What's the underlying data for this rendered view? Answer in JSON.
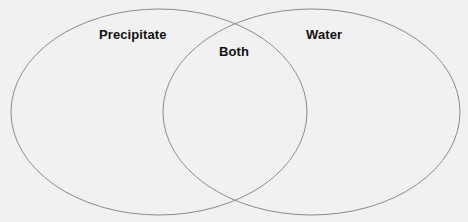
{
  "diagram": {
    "type": "venn",
    "sets": [
      {
        "id": "left",
        "label": "Precipitate"
      },
      {
        "id": "right",
        "label": "Water"
      }
    ],
    "intersection": {
      "label": "Both"
    },
    "colors": {
      "background": "#f1f1f1",
      "outline": "#8a8a8a",
      "text": "#111111"
    }
  }
}
